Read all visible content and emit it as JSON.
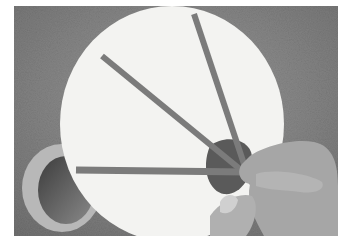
{
  "image": {
    "description": "Grayscale photograph of hands laying strips of tape across a large white circular board on a textured surface; a roll of tape sits at lower left",
    "colors": {
      "background_texture": "#8f8f8f",
      "board": "#f2f2f0",
      "tape": "#7d7d7d",
      "tape_roll": "#5a5a5a",
      "hands": "#a8a8a8",
      "frame": "#ffffff"
    }
  }
}
